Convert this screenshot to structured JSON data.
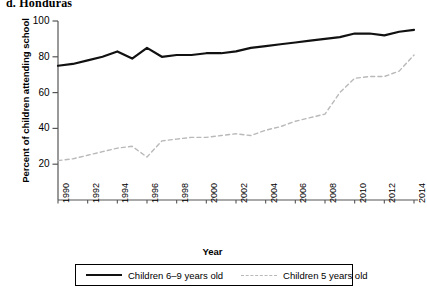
{
  "panel": {
    "title": "d. Honduras"
  },
  "legend": {
    "position": "bottom",
    "items": [
      {
        "label": "Children 6–9 years old",
        "style": "solid",
        "color": "#111111",
        "icon": "solid-line-swatch"
      },
      {
        "label": "Children 5 years old",
        "style": "dashed",
        "color": "#b9b9b9",
        "icon": "dashed-line-swatch"
      }
    ]
  },
  "chart_data": {
    "type": "line",
    "title": "d. Honduras",
    "xlabel": "Year",
    "ylabel": "Percent of children attending school",
    "xlim": [
      1990,
      2014
    ],
    "ylim": [
      0,
      100
    ],
    "grid": false,
    "legend_position": "bottom",
    "xticks": [
      "1990",
      "1992",
      "1994",
      "1996",
      "1998",
      "2000",
      "2002",
      "2004",
      "2006",
      "2008",
      "2010",
      "2012",
      "2014"
    ],
    "yticks": [
      "20",
      "40",
      "60",
      "80",
      "100"
    ],
    "x": [
      1990,
      1991,
      1992,
      1993,
      1994,
      1995,
      1996,
      1997,
      1998,
      1999,
      2000,
      2001,
      2002,
      2003,
      2004,
      2005,
      2006,
      2007,
      2008,
      2009,
      2010,
      2011,
      2012,
      2013,
      2014
    ],
    "series": [
      {
        "name": "Children 6–9 years old",
        "style": "solid",
        "color": "#111111",
        "values": [
          75,
          76,
          78,
          80,
          83,
          79,
          85,
          80,
          81,
          81,
          82,
          82,
          83,
          85,
          86,
          87,
          88,
          89,
          90,
          91,
          93,
          93,
          92,
          94,
          95
        ]
      },
      {
        "name": "Children 5 years old",
        "style": "dashed",
        "color": "#b9b9b9",
        "values": [
          22,
          23,
          25,
          27,
          29,
          30,
          24,
          33,
          34,
          35,
          35,
          36,
          37,
          36,
          39,
          41,
          44,
          46,
          48,
          60,
          68,
          69,
          69,
          72,
          81
        ]
      }
    ]
  }
}
